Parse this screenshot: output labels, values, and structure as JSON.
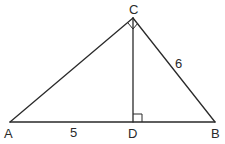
{
  "diagram": {
    "type": "right-triangle-with-altitude",
    "points": {
      "A": {
        "label": "A",
        "x": 10,
        "y": 122
      },
      "B": {
        "label": "B",
        "x": 215,
        "y": 122
      },
      "C": {
        "label": "C",
        "x": 133,
        "y": 18
      },
      "D": {
        "label": "D",
        "x": 133,
        "y": 122
      }
    },
    "segments": [
      {
        "from": "A",
        "to": "C"
      },
      {
        "from": "C",
        "to": "B"
      },
      {
        "from": "A",
        "to": "B"
      },
      {
        "from": "C",
        "to": "D"
      }
    ],
    "segment_labels": {
      "AD": "5",
      "BC": "6"
    },
    "right_angles": [
      "ACB",
      "CDB"
    ],
    "stroke_color": "#2a2a2a",
    "background_color": "#ffffff"
  }
}
